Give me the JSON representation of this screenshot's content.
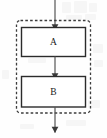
{
  "diagram": {
    "type": "flowchart",
    "title": "",
    "canvas": {
      "width": 107,
      "height": 138,
      "background": "#fefefe"
    },
    "group": {
      "name": "dashed-group-boundary",
      "shape": "rounded-rectangle",
      "stroke": "#3d3d3d",
      "stroke_dasharray": "2.6 2.2",
      "stroke_width": 1.3,
      "corner_radius": 4,
      "fill": "none",
      "x": 16.5,
      "y": 20.5,
      "width": 74,
      "height": 92.5
    },
    "nodes": [
      {
        "id": "A",
        "label": "A",
        "shape": "rectangle",
        "x": 21.5,
        "y": 27.5,
        "width": 64,
        "height": 29,
        "fill": "#ffffff",
        "stroke": "#2b2b2b",
        "stroke_width": 1.4
      },
      {
        "id": "B",
        "label": "B",
        "shape": "rectangle",
        "x": 21.5,
        "y": 76.5,
        "width": 64,
        "height": 30.5,
        "fill": "#ffffff",
        "stroke": "#2b2b2b",
        "stroke_width": 1.4
      }
    ],
    "edges": [
      {
        "id": "entry",
        "name": "entry-arrow",
        "from": "external-top",
        "to": "A",
        "x": 55,
        "y_start": 0,
        "y_end": 27.5,
        "arrowhead": "filled-triangle",
        "stroke": "#555555",
        "stroke_width": 1.2
      },
      {
        "id": "a-to-b",
        "name": "a-to-b-arrow",
        "from": "A",
        "to": "B",
        "x": 55,
        "y_start": 56.5,
        "y_end": 76.5,
        "arrowhead": "filled-triangle",
        "stroke": "#555555",
        "stroke_width": 1.2
      },
      {
        "id": "exit",
        "name": "exit-arrow",
        "from": "B",
        "to": "external-bottom",
        "x": 55,
        "y_start": 107,
        "y_end": 130,
        "arrowhead": "filled-triangle",
        "stroke": "#555555",
        "stroke_width": 1.2
      }
    ],
    "colors": {
      "node_stroke": "#2b2b2b",
      "node_fill": "#ffffff",
      "group_stroke": "#3d3d3d",
      "edge_stroke": "#555555",
      "label_color": "#1a1a1a",
      "background": "#fefefe"
    }
  }
}
